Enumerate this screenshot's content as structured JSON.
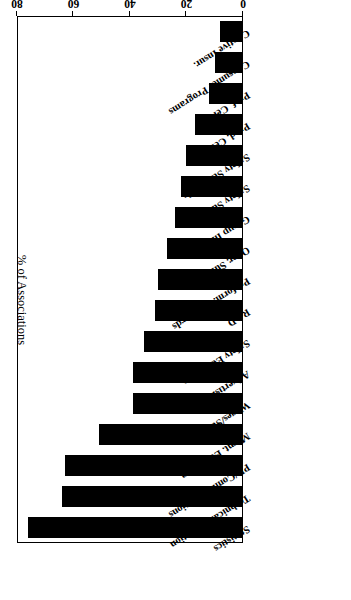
{
  "chart_data": {
    "type": "bar",
    "orientation": "horizontal",
    "title": "",
    "subtitle": "",
    "xlabel": "% of Associations",
    "ylabel": "",
    "axis_title": "% of Associations",
    "xlim": [
      0,
      80
    ],
    "ticks": [
      0,
      20,
      40,
      60,
      80
    ],
    "tick_labels": [
      "0",
      "20",
      "40",
      "60",
      "80"
    ],
    "grid": false,
    "legend": "none",
    "bar_color": "#000000",
    "frame_color": "#000000",
    "background": "#ffffff",
    "rotated_180": true,
    "categories": [
      "Statistics",
      "Technical Education",
      "PR/Communications",
      "Mgmt. Education",
      "Wages/Survey",
      "Advertising",
      "Safety Education",
      "R&D",
      "Perform. Standards",
      "Oper. Survey",
      "Group Insur.",
      "Safety Survey",
      "Safety Standards",
      "Prod. Cert.",
      "Prof. Cert.",
      "Consumer Programs",
      "Captive Insur."
    ],
    "values": [
      76,
      64,
      63,
      51,
      39,
      39,
      35,
      31,
      30,
      27,
      24,
      22,
      20,
      17,
      12,
      10,
      8
    ]
  },
  "axis": {
    "title": "% of Associations"
  }
}
